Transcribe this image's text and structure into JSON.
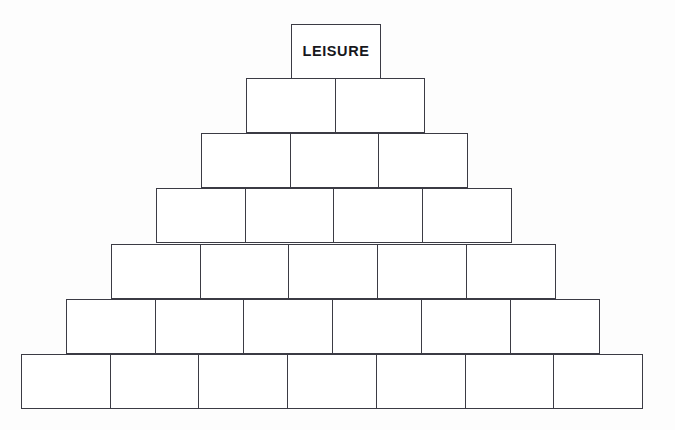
{
  "diagram": {
    "type": "pyramid",
    "title": "",
    "background_color": "#fdfdfd",
    "stroke_color": "#3b3b44",
    "text_color": "#17171c",
    "row_count": 7,
    "block_width": 90,
    "block_height": 55,
    "center_x": 336.5,
    "top_y": 24,
    "rows": [
      {
        "index": 1,
        "block_count": 1,
        "left": 291,
        "top": 24,
        "blocks": [
          {
            "label": "LEISURE"
          }
        ]
      },
      {
        "index": 2,
        "block_count": 2,
        "left": 246,
        "top": 78,
        "blocks": [
          {
            "label": ""
          },
          {
            "label": ""
          }
        ]
      },
      {
        "index": 3,
        "block_count": 3,
        "left": 201,
        "top": 133,
        "blocks": [
          {
            "label": ""
          },
          {
            "label": ""
          },
          {
            "label": ""
          }
        ]
      },
      {
        "index": 4,
        "block_count": 4,
        "left": 156,
        "top": 188,
        "blocks": [
          {
            "label": ""
          },
          {
            "label": ""
          },
          {
            "label": ""
          },
          {
            "label": ""
          }
        ]
      },
      {
        "index": 5,
        "block_count": 5,
        "left": 111,
        "top": 244,
        "blocks": [
          {
            "label": ""
          },
          {
            "label": ""
          },
          {
            "label": ""
          },
          {
            "label": ""
          },
          {
            "label": ""
          }
        ]
      },
      {
        "index": 6,
        "block_count": 6,
        "left": 66,
        "top": 299,
        "blocks": [
          {
            "label": ""
          },
          {
            "label": ""
          },
          {
            "label": ""
          },
          {
            "label": ""
          },
          {
            "label": ""
          },
          {
            "label": ""
          }
        ]
      },
      {
        "index": 7,
        "block_count": 7,
        "left": 21,
        "top": 354,
        "blocks": [
          {
            "label": ""
          },
          {
            "label": ""
          },
          {
            "label": ""
          },
          {
            "label": ""
          },
          {
            "label": ""
          },
          {
            "label": ""
          },
          {
            "label": ""
          }
        ]
      }
    ]
  }
}
